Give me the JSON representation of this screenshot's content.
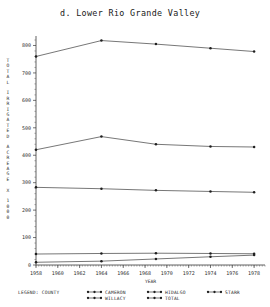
{
  "chart_data": {
    "type": "line",
    "title": "d. Lower Rio Grande Valley",
    "xlabel": "YEAR",
    "ylabel": "TOTAL IRRIGATED ACREAGE X 1000",
    "xlim": [
      1958,
      1979
    ],
    "ylim": [
      0,
      820
    ],
    "xticks": [
      1958,
      1960,
      1962,
      1964,
      1966,
      1968,
      1970,
      1972,
      1974,
      1976,
      1978
    ],
    "yticks": [
      0,
      100,
      200,
      300,
      400,
      500,
      600,
      700,
      800
    ],
    "grid": false,
    "legend_position": "below",
    "legend_title": "LEGEND: COUNTY",
    "x": [
      1958,
      1964,
      1969,
      1974,
      1978
    ],
    "series": [
      {
        "name": "TOTAL",
        "values": [
          760,
          818,
          805,
          790,
          778
        ]
      },
      {
        "name": "HIDALGO",
        "values": [
          420,
          468,
          440,
          432,
          430
        ]
      },
      {
        "name": "CAMERON",
        "values": [
          283,
          278,
          272,
          268,
          265
        ]
      },
      {
        "name": "WILLACY",
        "values": [
          40,
          42,
          43,
          42,
          41
        ]
      },
      {
        "name": "STARR",
        "values": [
          10,
          14,
          22,
          30,
          36
        ]
      }
    ]
  },
  "legend": {
    "title": "LEGEND: COUNTY",
    "entries": [
      {
        "label": "CAMERON"
      },
      {
        "label": "WILLACY"
      },
      {
        "label": "HIDALGO"
      },
      {
        "label": "TOTAL"
      },
      {
        "label": "STARR"
      }
    ]
  }
}
